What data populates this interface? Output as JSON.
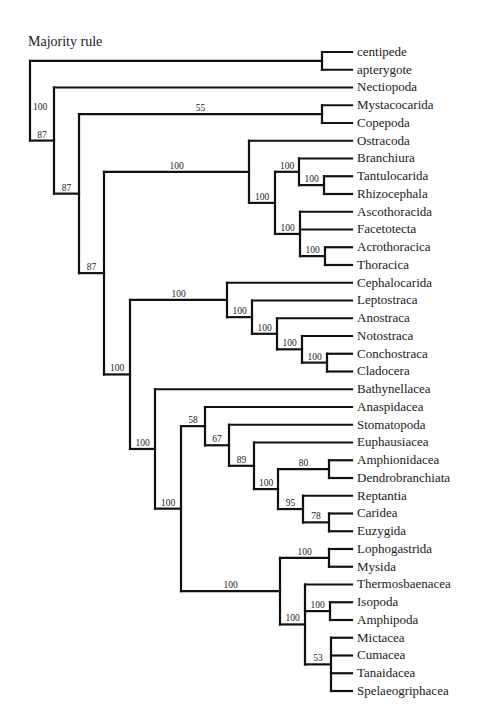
{
  "title": "Majority rule",
  "tree": {
    "id": "root",
    "support": "100",
    "children": [
      {
        "id": "outgroup",
        "support": "",
        "children": [
          {
            "name": "centipede"
          },
          {
            "name": "apterygote"
          }
        ]
      },
      {
        "id": "n1",
        "support": "87",
        "children": [
          {
            "name": "Nectiopoda"
          },
          {
            "id": "n2",
            "support": "87",
            "children": [
              {
                "id": "mystaco",
                "support": "55",
                "children": [
                  {
                    "name": "Mystacocarida"
                  },
                  {
                    "name": "Copepoda"
                  }
                ]
              },
              {
                "id": "n3",
                "support": "87",
                "children": [
                  {
                    "id": "ostra",
                    "support": "100",
                    "children": [
                      {
                        "name": "Ostracoda"
                      },
                      {
                        "id": "thecostraca",
                        "support": "100",
                        "children": [
                          {
                            "id": "branch",
                            "support": "100",
                            "children": [
                              {
                                "name": "Branchiura"
                              },
                              {
                                "id": "tantulo",
                                "support": "100",
                                "children": [
                                  {
                                    "name": "Tantulocarida"
                                  },
                                  {
                                    "name": "Rhizocephala"
                                  }
                                ]
                              }
                            ]
                          },
                          {
                            "id": "ascoth",
                            "support": "100",
                            "children": [
                              {
                                "name": "Ascothoracida"
                              },
                              {
                                "name": "Facetotecta"
                              },
                              {
                                "id": "acro",
                                "support": "100",
                                "children": [
                                  {
                                    "name": "Acrothoracica"
                                  },
                                  {
                                    "name": "Thoracica"
                                  }
                                ]
                              }
                            ]
                          }
                        ]
                      }
                    ]
                  },
                  {
                    "id": "n4",
                    "support": "100",
                    "children": [
                      {
                        "id": "cephalo",
                        "support": "100",
                        "children": [
                          {
                            "name": "Cephalocarida"
                          },
                          {
                            "id": "lepto",
                            "support": "100",
                            "children": [
                              {
                                "name": "Leptostraca"
                              },
                              {
                                "id": "anos",
                                "support": "100",
                                "children": [
                                  {
                                    "name": "Anostraca"
                                  },
                                  {
                                    "id": "noto",
                                    "support": "100",
                                    "children": [
                                      {
                                        "name": "Notostraca"
                                      },
                                      {
                                        "id": "concho",
                                        "support": "100",
                                        "children": [
                                          {
                                            "name": "Conchostraca"
                                          },
                                          {
                                            "name": "Cladocera"
                                          }
                                        ]
                                      }
                                    ]
                                  }
                                ]
                              }
                            ]
                          }
                        ]
                      },
                      {
                        "id": "n5",
                        "support": "100",
                        "children": [
                          {
                            "name": "Bathynellacea"
                          },
                          {
                            "id": "n6",
                            "support": "100",
                            "children": [
                              {
                                "id": "anasp",
                                "support": "58",
                                "children": [
                                  {
                                    "name": "Anaspidacea"
                                  },
                                  {
                                    "id": "stomato",
                                    "support": "67",
                                    "children": [
                                      {
                                        "name": "Stomatopoda"
                                      },
                                      {
                                        "id": "euph",
                                        "support": "89",
                                        "children": [
                                          {
                                            "name": "Euphausiacea"
                                          },
                                          {
                                            "id": "deca",
                                            "support": "100",
                                            "children": [
                                              {
                                                "id": "amphion",
                                                "support": "80",
                                                "children": [
                                                  {
                                                    "name": "Amphionidacea"
                                                  },
                                                  {
                                                    "name": "Dendrobranchiata"
                                                  }
                                                ]
                                              },
                                              {
                                                "id": "rept",
                                                "support": "95",
                                                "children": [
                                                  {
                                                    "name": "Reptantia"
                                                  },
                                                  {
                                                    "id": "carid",
                                                    "support": "78",
                                                    "children": [
                                                      {
                                                        "name": "Caridea"
                                                      },
                                                      {
                                                        "name": "Euzygida"
                                                      }
                                                    ]
                                                  }
                                                ]
                                              }
                                            ]
                                          }
                                        ]
                                      }
                                    ]
                                  }
                                ]
                              },
                              {
                                "id": "pera",
                                "support": "100",
                                "children": [
                                  {
                                    "id": "lopho",
                                    "support": "100",
                                    "children": [
                                      {
                                        "name": "Lophogastrida"
                                      },
                                      {
                                        "name": "Mysida"
                                      }
                                    ]
                                  },
                                  {
                                    "id": "thermo",
                                    "support": "100",
                                    "children": [
                                      {
                                        "name": "Thermosbaenacea"
                                      },
                                      {
                                        "id": "iso",
                                        "support": "100",
                                        "children": [
                                          {
                                            "name": "Isopoda"
                                          },
                                          {
                                            "name": "Amphipoda"
                                          }
                                        ]
                                      },
                                      {
                                        "id": "mict",
                                        "support": "53",
                                        "children": [
                                          {
                                            "name": "Mictacea"
                                          },
                                          {
                                            "name": "Cumacea"
                                          },
                                          {
                                            "name": "Tanaidacea"
                                          },
                                          {
                                            "name": "Spelaeogriphacea"
                                          }
                                        ]
                                      }
                                    ]
                                  }
                                ]
                              }
                            ]
                          }
                        ]
                      }
                    ]
                  }
                ]
              }
            ]
          }
        ]
      }
    ]
  }
}
